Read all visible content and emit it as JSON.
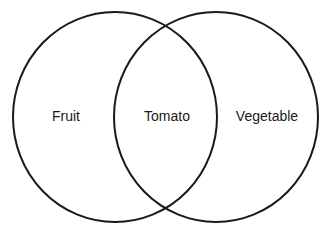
{
  "diagram": {
    "type": "venn",
    "stroke_color": "#1a1a1a",
    "background": "#ffffff",
    "sets": [
      {
        "name": "left-set",
        "label": "Fruit",
        "cx": 115,
        "cy": 117,
        "rx": 102,
        "ry": 105,
        "label_x": 66,
        "label_y": 121
      },
      {
        "name": "right-set",
        "label": "Vegetable",
        "cx": 216,
        "cy": 117,
        "rx": 102,
        "ry": 105,
        "label_x": 267,
        "label_y": 121
      }
    ],
    "intersection": {
      "label": "Tomato",
      "label_x": 167,
      "label_y": 121
    }
  }
}
